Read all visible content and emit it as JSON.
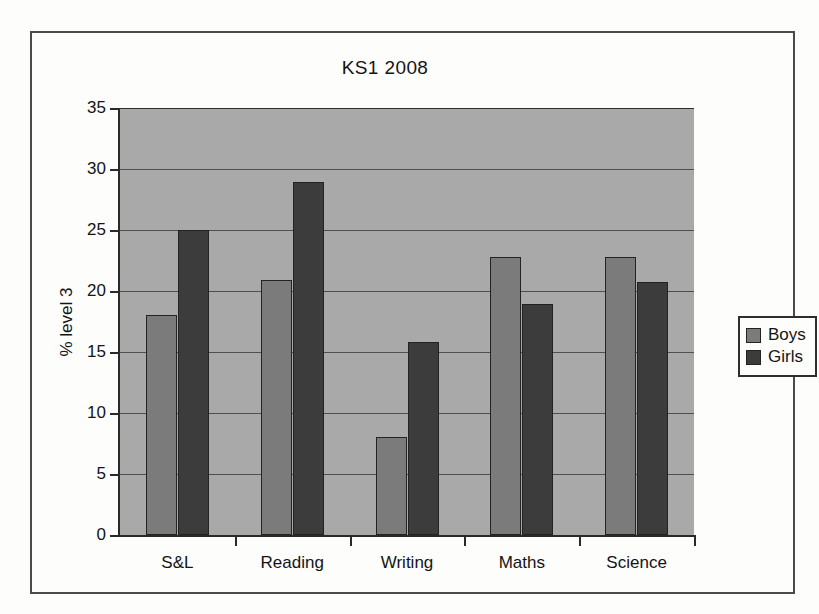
{
  "chart_data": {
    "type": "bar",
    "title": "KS1 2008",
    "xlabel": "",
    "ylabel": "% level 3",
    "ylim": [
      0,
      35
    ],
    "ytick_step": 5,
    "yticks": [
      0,
      5,
      10,
      15,
      20,
      25,
      30,
      35
    ],
    "ytick_labels": [
      "0",
      "5",
      "10",
      "15",
      "20",
      "25",
      "30",
      "35"
    ],
    "grid": true,
    "legend_position": "right",
    "categories": [
      "S&L",
      "Reading",
      "Writing",
      "Maths",
      "Science"
    ],
    "series": [
      {
        "name": "Boys",
        "color": "#7b7b7b",
        "values": [
          18.0,
          20.9,
          8.0,
          22.8,
          22.8
        ]
      },
      {
        "name": "Girls",
        "color": "#3c3c3c",
        "values": [
          25.0,
          28.9,
          15.8,
          18.9,
          20.7
        ]
      }
    ],
    "plot_background": "#a9a9a9",
    "axis_color": "#2a2a2a",
    "gridline_color": "#4f4f4f"
  }
}
